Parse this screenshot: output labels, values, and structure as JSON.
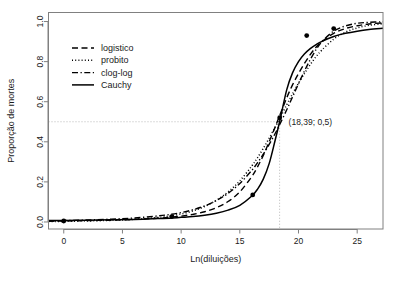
{
  "chart_data": {
    "type": "line",
    "title": "",
    "xlabel": "Ln(diluições)",
    "ylabel": "Proporção de mortes",
    "xlim": [
      -1.3,
      27.2
    ],
    "ylim": [
      -0.035,
      1.045
    ],
    "xticks": [
      0,
      5,
      10,
      15,
      20,
      25
    ],
    "xtick_labels": [
      "0",
      "5",
      "10",
      "15",
      "20",
      "25"
    ],
    "yticks": [
      0.0,
      0.2,
      0.4,
      0.6,
      0.8,
      1.0
    ],
    "ytick_labels": [
      "0.0",
      "0.2",
      "0.4",
      "0.6",
      "0.8",
      "1.0"
    ],
    "grid": false,
    "legend_position": "upper-left-inside",
    "series": [
      {
        "name": "logistico",
        "style": "dashed",
        "color": "#000000",
        "x": [
          -1.3,
          0,
          2,
          4,
          6,
          8,
          9,
          10,
          11,
          12,
          13,
          14,
          15,
          16,
          16.5,
          17,
          17.5,
          18,
          18.39,
          19,
          19.5,
          20,
          20.5,
          21,
          21.5,
          22,
          23,
          24,
          25,
          26,
          27.2
        ],
        "y": [
          0.004,
          0.005,
          0.007,
          0.009,
          0.013,
          0.019,
          0.023,
          0.029,
          0.038,
          0.051,
          0.071,
          0.102,
          0.15,
          0.225,
          0.274,
          0.332,
          0.4,
          0.472,
          0.53,
          0.62,
          0.685,
          0.74,
          0.79,
          0.835,
          0.872,
          0.9,
          0.941,
          0.965,
          0.979,
          0.988,
          0.993
        ]
      },
      {
        "name": "probito",
        "style": "dotted",
        "color": "#000000",
        "x": [
          -1.3,
          0,
          2,
          4,
          6,
          8,
          9,
          10,
          11,
          12,
          13,
          14,
          15,
          16,
          16.5,
          17,
          17.5,
          18,
          18.39,
          19,
          19.5,
          20,
          20.5,
          21,
          21.5,
          22,
          23,
          24,
          25,
          26,
          27.2
        ],
        "y": [
          0.002,
          0.003,
          0.005,
          0.008,
          0.013,
          0.022,
          0.03,
          0.04,
          0.055,
          0.077,
          0.108,
          0.15,
          0.205,
          0.278,
          0.32,
          0.367,
          0.418,
          0.472,
          0.515,
          0.585,
          0.64,
          0.692,
          0.74,
          0.785,
          0.825,
          0.858,
          0.912,
          0.947,
          0.968,
          0.981,
          0.989
        ]
      },
      {
        "name": "clog-log",
        "style": "dash-dot",
        "color": "#000000",
        "x": [
          -1.3,
          0,
          2,
          4,
          6,
          8,
          9,
          10,
          11,
          12,
          13,
          14,
          15,
          16,
          16.5,
          17,
          17.5,
          18,
          18.39,
          19,
          19.5,
          20,
          20.5,
          21,
          21.5,
          22,
          23,
          24,
          25,
          26,
          27.2
        ],
        "y": [
          0.006,
          0.007,
          0.01,
          0.014,
          0.02,
          0.03,
          0.037,
          0.047,
          0.061,
          0.08,
          0.107,
          0.143,
          0.192,
          0.256,
          0.295,
          0.338,
          0.387,
          0.44,
          0.485,
          0.56,
          0.625,
          0.69,
          0.752,
          0.81,
          0.86,
          0.9,
          0.952,
          0.978,
          0.991,
          0.996,
          0.999
        ]
      },
      {
        "name": "Cauchy",
        "style": "solid",
        "color": "#000000",
        "x": [
          -1.3,
          0,
          2,
          4,
          6,
          8,
          9,
          10,
          11,
          12,
          13,
          14,
          15,
          16,
          16.5,
          17,
          17.5,
          18,
          18.39,
          19,
          19.5,
          20,
          20.5,
          21,
          21.5,
          22,
          23,
          24,
          25,
          26,
          27.2
        ],
        "y": [
          0.007,
          0.008,
          0.009,
          0.011,
          0.013,
          0.017,
          0.019,
          0.023,
          0.027,
          0.034,
          0.044,
          0.059,
          0.083,
          0.128,
          0.163,
          0.214,
          0.291,
          0.405,
          0.5,
          0.66,
          0.745,
          0.8,
          0.838,
          0.865,
          0.885,
          0.901,
          0.925,
          0.941,
          0.952,
          0.96,
          0.966
        ]
      }
    ],
    "points": {
      "name": "observações",
      "x": [
        0.0,
        9.2,
        16.1,
        18.4,
        20.7,
        23.0
      ],
      "y": [
        0.005,
        0.027,
        0.135,
        0.52,
        0.93,
        0.965
      ]
    },
    "reference_lines": {
      "horizontal_y": 0.5,
      "vertical_x": 18.39,
      "style": "dotted",
      "color": "#b0b0b0"
    },
    "annotations": [
      {
        "text": "(18,39; 0,5)",
        "x": 18.9,
        "y": 0.5
      }
    ],
    "legend": [
      {
        "label": "logistico",
        "style": "dashed"
      },
      {
        "label": "probito",
        "style": "dotted"
      },
      {
        "label": "clog-log",
        "style": "dash-dot"
      },
      {
        "label": "Cauchy",
        "style": "solid"
      }
    ]
  }
}
